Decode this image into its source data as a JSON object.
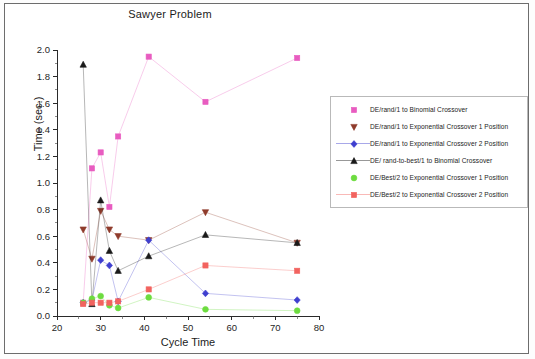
{
  "chart_data": {
    "type": "line",
    "title": "Sawyer Problem",
    "xlabel": "Cycle Time",
    "ylabel": "Time (sec.)",
    "xlim": [
      20,
      80
    ],
    "ylim": [
      0.0,
      2.0
    ],
    "xticks": [
      20,
      30,
      40,
      50,
      60,
      70,
      80
    ],
    "yticks": [
      0.0,
      0.2,
      0.4,
      0.6,
      0.8,
      1.0,
      1.2,
      1.4,
      1.6,
      1.8,
      2.0
    ],
    "grid": false,
    "legend_position": "right",
    "series": [
      {
        "name": "DE/rand/1 to Binomial Crossover",
        "color": "#e85cc0",
        "marker": "square",
        "x": [
          26,
          28,
          30,
          32,
          34,
          41,
          54,
          75
        ],
        "y": [
          0.1,
          1.11,
          1.23,
          0.82,
          1.35,
          1.95,
          1.61,
          1.94
        ]
      },
      {
        "name": "DE/rand/1 to Exponential Crossover 1 Position",
        "color": "#8f3b2b",
        "marker": "triangle-down",
        "x": [
          26,
          28,
          30,
          32,
          34,
          41,
          54,
          75
        ],
        "y": [
          0.65,
          0.43,
          0.79,
          0.65,
          0.6,
          0.57,
          0.78,
          0.55
        ]
      },
      {
        "name": "DE/rand/1 to Exponential Crossover 2 Position",
        "color": "#3f3fcf",
        "marker": "diamond",
        "x": [
          26,
          28,
          30,
          32,
          34,
          41,
          54,
          75
        ],
        "y": [
          0.1,
          0.12,
          0.42,
          0.38,
          0.11,
          0.57,
          0.17,
          0.12
        ]
      },
      {
        "name": "DE/ rand-to-best/1 to Binomial Crossover",
        "color": "#1a1a1a",
        "marker": "triangle-up",
        "x": [
          26,
          28,
          30,
          32,
          34,
          41,
          54,
          75
        ],
        "y": [
          1.89,
          0.09,
          0.87,
          0.49,
          0.34,
          0.45,
          0.61,
          0.55
        ]
      },
      {
        "name": "DE/Best/2 to Exponential Crossover 1 Position",
        "color": "#6ddc3f",
        "marker": "circle",
        "x": [
          26,
          28,
          30,
          32,
          34,
          41,
          54,
          75
        ],
        "y": [
          0.1,
          0.13,
          0.15,
          0.08,
          0.06,
          0.14,
          0.05,
          0.04
        ]
      },
      {
        "name": "DE/Best/2 to Exponential Crossover 2 Position",
        "color": "#f2635f",
        "marker": "square",
        "x": [
          26,
          28,
          30,
          32,
          34,
          41,
          54,
          75
        ],
        "y": [
          0.09,
          0.1,
          0.1,
          0.1,
          0.11,
          0.2,
          0.38,
          0.34
        ]
      }
    ]
  },
  "legend": {
    "items": [
      {
        "label": "DE/rand/1 to Binomial Crossover",
        "color": "#e85cc0",
        "marker": "square-icon",
        "line": false
      },
      {
        "label": "DE/rand/1 to Exponential Crossover 1 Position",
        "color": "#8f3b2b",
        "marker": "triangle-down-icon",
        "line": false
      },
      {
        "label": "DE/rand/1 to Exponential Crossover 2 Position",
        "color": "#3f3fcf",
        "marker": "diamond-icon",
        "line": true
      },
      {
        "label": "DE/ rand-to-best/1 to Binomial Crossover",
        "color": "#1a1a1a",
        "marker": "triangle-up-icon",
        "line": true
      },
      {
        "label": "DE/Best/2 to Exponential Crossover 1 Position",
        "color": "#6ddc3f",
        "marker": "circle-icon",
        "line": false
      },
      {
        "label": "DE/Best/2 to Exponential Crossover 2 Position",
        "color": "#f2635f",
        "marker": "square-icon",
        "line": true
      }
    ]
  }
}
